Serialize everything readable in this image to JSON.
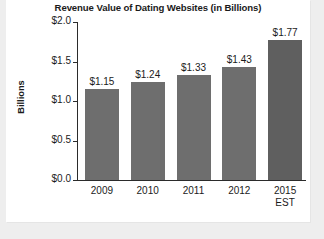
{
  "chart_data": {
    "type": "bar",
    "title": "Revenue Value of Dating Websites (in Billions)",
    "xlabel": "",
    "ylabel": "Billions",
    "categories": [
      "2009",
      "2010",
      "2011",
      "2012",
      "2015\nEST"
    ],
    "values": [
      1.15,
      1.24,
      1.33,
      1.43,
      1.77
    ],
    "value_labels": [
      "$1.15",
      "$1.24",
      "$1.33",
      "$1.43",
      "$1.77"
    ],
    "ylim": [
      0.0,
      2.0
    ],
    "ytick_values": [
      0.0,
      0.5,
      1.0,
      1.5,
      2.0
    ],
    "ytick_labels": [
      "$0.0",
      "$0.5",
      "$1.0",
      "$1.5",
      "$2.0"
    ],
    "grid": false,
    "legend": null,
    "bar_color": "#6e6e6e",
    "highlight_bar_color": "#5f5f5f",
    "axis_color": "#2b2b2b",
    "background": "#ffffff",
    "page_background": "#eeeeee"
  }
}
